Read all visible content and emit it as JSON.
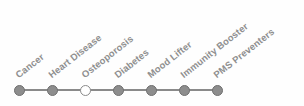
{
  "figure": {
    "width": 304,
    "height": 106,
    "background_color": "#fefefe",
    "axis_line_color": "#8a8a8a",
    "node_fill_color": "#8d8d8d",
    "node_border_color": "#6f6f6f",
    "node_hollow_fill_color": "#ffffff",
    "label_color": "#8f8f8f",
    "label_rotation_deg": -38
  },
  "axis": {
    "line_start_x": 19,
    "line_end_x": 217,
    "line_y": 90,
    "node_spacing_px": 33
  },
  "nodes": [
    {
      "label": "Cancer",
      "x": 19,
      "y": 90,
      "state": "filled"
    },
    {
      "label": "Heart Disease",
      "x": 52,
      "y": 90,
      "state": "filled"
    },
    {
      "label": "Osteoporosis",
      "x": 85,
      "y": 90,
      "state": "hollow"
    },
    {
      "label": "Diabetes",
      "x": 118,
      "y": 90,
      "state": "filled"
    },
    {
      "label": "Mood Lifter",
      "x": 151,
      "y": 90,
      "state": "filled"
    },
    {
      "label": "Immunity Booster",
      "x": 184,
      "y": 90,
      "state": "filled"
    },
    {
      "label": "PMS Preventers",
      "x": 217,
      "y": 90,
      "state": "filled"
    }
  ],
  "chart_data": {
    "type": "scatter",
    "title": "",
    "xlabel": "",
    "ylabel": "",
    "grid": false,
    "legend_position": "none",
    "categories": [
      "Cancer",
      "Heart Disease",
      "Osteoporosis",
      "Diabetes",
      "Mood Lifter",
      "Immunity Booster",
      "PMS Preventers"
    ],
    "values": [
      1,
      1,
      1,
      1,
      1,
      1,
      1
    ],
    "x": [
      19,
      52,
      85,
      118,
      151,
      184,
      217
    ],
    "marker_states": [
      "filled",
      "filled",
      "hollow",
      "filled",
      "filled",
      "filled",
      "filled"
    ],
    "highlighted_category": "Osteoporosis",
    "tick_labels": [
      "Cancer",
      "Heart Disease",
      "Osteoporosis",
      "Diabetes",
      "Mood Lifter",
      "Immunity Booster",
      "PMS Preventers"
    ],
    "tick_label_rotation_deg": -38,
    "annotations": []
  }
}
